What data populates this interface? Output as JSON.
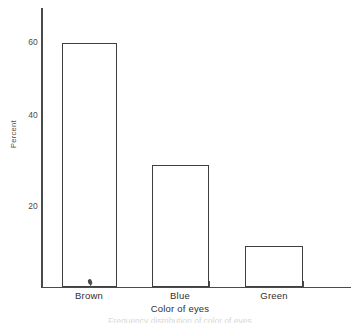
{
  "chart_data": {
    "type": "bar",
    "title": "",
    "categories": [
      "Brown",
      "Blue",
      "Green"
    ],
    "values": [
      60,
      30,
      10
    ],
    "xlabel": "Color of eyes",
    "ylabel": "Percent",
    "ylim": [
      0,
      68
    ],
    "yticks": [
      20,
      40,
      60
    ],
    "ytick_labels": [
      "20",
      "40",
      "60"
    ],
    "grid": false,
    "legend": false,
    "bar_style": {
      "fill": "#ffffff",
      "edge": "#3f3f3f"
    }
  },
  "axis": {
    "y_title": "Percent",
    "x_title": "Color of eyes",
    "tick_60": "60",
    "tick_40": "40",
    "tick_20": "20"
  },
  "categories": {
    "brown": "Brown",
    "blue": "Blue",
    "green": "Green"
  },
  "caption": {
    "text": "Frequency distribution of color of eyes"
  },
  "colors": {
    "axis": "#4a4a4a",
    "bar_edge": "#3f3f3f",
    "text": "#2f2f2f",
    "background": "#ffffff"
  }
}
